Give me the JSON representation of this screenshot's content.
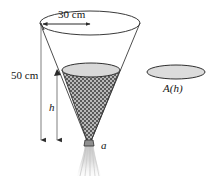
{
  "figure": {
    "name": "draining-conical-funnel",
    "background_color": "#ffffff",
    "stroke_color": "#3a3a3a",
    "labels": {
      "top_diameter": "30 cm",
      "cone_height": "50 cm",
      "liquid_depth": "h",
      "orifice": "a",
      "cross_section_area": "A(h)"
    },
    "colors": {
      "outline": "#3a3a3a",
      "liquid_surface_fill": "#d8d8d8",
      "liquid_hatch_dark": "#555555",
      "liquid_hatch_light": "#bdbdbd",
      "area_disk_fill": "#dcdcdc",
      "stream_fill": "#d5d5d5",
      "text": "#141414"
    },
    "geometry": {
      "top_ellipse": {
        "cx": 90,
        "cy": 23,
        "rx": 50,
        "ry": 12
      },
      "liquid_ellipse": {
        "cx": 91,
        "cy": 70,
        "rx": 29,
        "ry": 7
      },
      "area_ellipse": {
        "cx": 176,
        "cy": 72,
        "rx": 29,
        "ry": 7
      },
      "cone_apex": {
        "x": 89,
        "y": 146
      },
      "dimension_origin": {
        "x": 41,
        "y": 23
      },
      "arrow_bottom_y": 141,
      "height_arrow_x": 41,
      "depth_arrow_x": 57
    }
  }
}
